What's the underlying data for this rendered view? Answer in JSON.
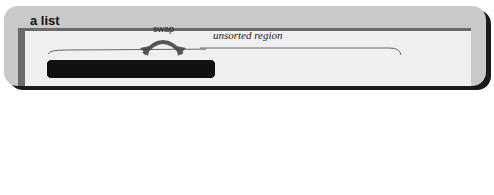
{
  "diagram": {
    "title": "a list",
    "array_label": "items (an array)",
    "swap_label": "swap",
    "region_label": "unsorted region",
    "indices": [
      "1",
      "2",
      "3",
      "4",
      "5",
      "6",
      "7",
      "8",
      "9",
      "10"
    ],
    "top_row_nodes": [
      {
        "index": "1",
        "label": "(dattuck,...)"
      },
      {
        "index": "3",
        "label": "(scramoge,...)"
      },
      {
        "index": "5",
        "label": "(duddo,...)"
      },
      {
        "index": "7",
        "label": "(flunary,...)"
      },
      {
        "index": "9",
        "label": "(bindle,...)"
      }
    ],
    "bottom_row_nodes": [
      {
        "index": "2",
        "label": "(rigolet,...)"
      },
      {
        "index": "4",
        "label": "(aa1st,...)"
      },
      {
        "index": "6",
        "label": "(harbottle,...)"
      },
      {
        "index": "8",
        "label": "(spreakley,...)"
      },
      {
        "index": "10",
        "label": "(knaptoft,...)"
      }
    ]
  }
}
